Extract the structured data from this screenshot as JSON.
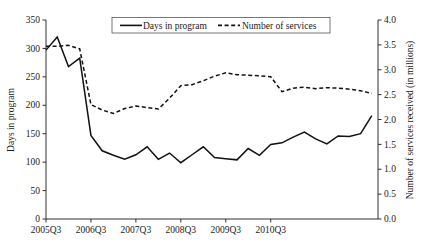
{
  "chart_data": {
    "type": "line",
    "title": "",
    "xlabel": "",
    "ylabel": "Days in program",
    "y2label": "Number of services received (in millions)",
    "grid": false,
    "legend_position": "top-center",
    "ylim": [
      0,
      350
    ],
    "y2lim": [
      0,
      4.0
    ],
    "yticks": [
      "350",
      "300",
      "250",
      "200",
      "150",
      "100",
      "50",
      "0"
    ],
    "ytick_values": [
      350,
      300,
      250,
      200,
      150,
      100,
      50,
      0
    ],
    "y2ticks": [
      "4.0",
      "3.5",
      "3.0",
      "2.5",
      "2.0",
      "1.5",
      "1.0",
      "0.5",
      "0.0"
    ],
    "y2tick_values": [
      4.0,
      3.5,
      3.0,
      2.5,
      2.0,
      1.5,
      1.0,
      0.5,
      0.0
    ],
    "xticks": [
      "2005Q3",
      "2006Q3",
      "2007Q3",
      "2008Q3",
      "2009Q3",
      "2010Q3"
    ],
    "xtick_indices": [
      0,
      4,
      8,
      12,
      16,
      20
    ],
    "x": [
      "2005Q3",
      "2005Q4",
      "2006Q1",
      "2006Q2",
      "2006Q3",
      "2006Q4",
      "2007Q1",
      "2007Q2",
      "2007Q3",
      "2007Q4",
      "2008Q1",
      "2008Q2",
      "2008Q3",
      "2008Q4",
      "2009Q1",
      "2009Q2",
      "2009Q3",
      "2009Q4",
      "2010Q1",
      "2010Q2",
      "2010Q3",
      "2010Q4",
      "2011Q1",
      "2011Q2"
    ],
    "series": [
      {
        "name": "Days in program",
        "axis": "left",
        "style": "solid",
        "unit": "days",
        "values": [
          297,
          320,
          268,
          283,
          147,
          120,
          112,
          105,
          113,
          127,
          105,
          116,
          99,
          113,
          127,
          108,
          106,
          104,
          124,
          112,
          131,
          134,
          144,
          153
        ]
      },
      {
        "name": "Number of services",
        "axis": "right",
        "style": "dashed",
        "unit": "millions",
        "values": [
          3.47,
          3.47,
          3.49,
          3.42,
          2.3,
          2.19,
          2.12,
          2.22,
          2.27,
          2.24,
          2.21,
          2.43,
          2.68,
          2.7,
          2.78,
          2.87,
          2.94,
          2.9,
          2.89,
          2.88,
          2.86,
          2.56,
          2.63,
          2.65
        ]
      }
    ],
    "series_extra_note": "solid line continues to 2011 peak",
    "solid_tail": [
      141,
      132,
      146,
      145,
      150,
      182
    ],
    "dashed_tail": [
      2.62,
      2.64,
      2.63,
      2.61,
      2.58,
      2.52
    ]
  },
  "legend": {
    "entries": [
      {
        "label": "Days in program",
        "marker": "solid-line"
      },
      {
        "label": "Number of services",
        "marker": "dashed-line"
      }
    ]
  },
  "axes": {
    "left_title": "Days in program",
    "right_title": "Number of services received (in millions)"
  }
}
